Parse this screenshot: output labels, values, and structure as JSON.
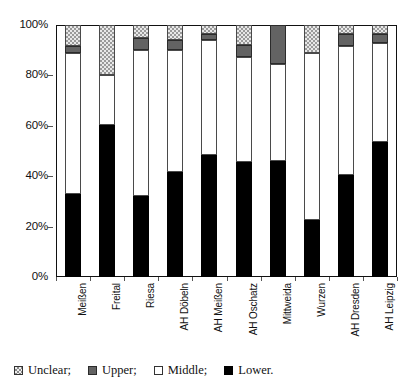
{
  "chart_data": {
    "type": "bar",
    "subtype": "stacked-percentage-column",
    "title": "",
    "subtitle": "",
    "xlabel": "",
    "ylabel": "",
    "ylim": [
      0,
      100
    ],
    "yticks": [
      "0%",
      "20%",
      "40%",
      "60%",
      "80%",
      "100%"
    ],
    "ytick_values": [
      0,
      20,
      40,
      60,
      80,
      100
    ],
    "grid": false,
    "legend_position": "bottom",
    "categories": [
      "Meißen",
      "Freital",
      "Riesa",
      "AH Döbeln",
      "AH Meißen",
      "AH Oschatz",
      "Mittweida",
      "Wurzen",
      "AH Dresden",
      "AH Leipzig"
    ],
    "series": [
      {
        "name": "Lower.",
        "key": "lower",
        "color": "#000000",
        "values": [
          33.0,
          60.5,
          32.0,
          41.5,
          48.5,
          45.5,
          46.0,
          22.5,
          40.5,
          53.5
        ]
      },
      {
        "name": "Middle;",
        "key": "middle",
        "color": "#ffffff",
        "values": [
          56.0,
          19.5,
          58.0,
          48.5,
          45.5,
          42.0,
          38.5,
          66.5,
          51.0,
          39.5
        ]
      },
      {
        "name": "Upper;",
        "key": "upper",
        "color": "#636363",
        "values": [
          2.5,
          0.0,
          5.0,
          4.0,
          2.5,
          4.5,
          15.5,
          0.0,
          5.0,
          3.5
        ]
      },
      {
        "name": "Unclear;",
        "key": "unclear",
        "color": "#e8e8e8",
        "values": [
          8.5,
          20.0,
          5.0,
          6.0,
          3.5,
          8.0,
          0.0,
          11.0,
          3.5,
          3.5
        ]
      }
    ]
  },
  "legend": {
    "items": [
      {
        "label": "Unclear;",
        "swatch": "unclear-swatch-icon"
      },
      {
        "label": "Upper;",
        "swatch": "upper-swatch-icon"
      },
      {
        "label": "Middle;",
        "swatch": "middle-swatch-icon"
      },
      {
        "label": "Lower.",
        "swatch": "lower-swatch-icon"
      }
    ]
  }
}
